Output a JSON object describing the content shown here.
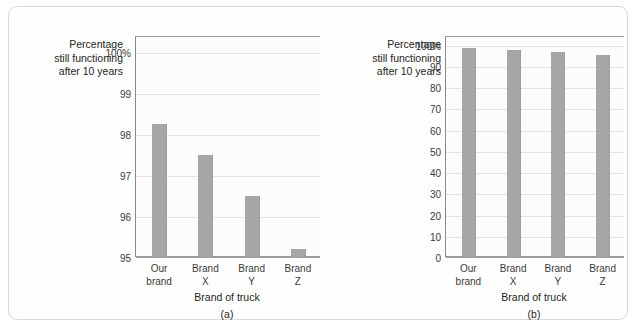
{
  "figure": {
    "panels": [
      {
        "id": "a",
        "letter": "(a)",
        "y_caption": "Percentage\nstill functioning\nafter 10 years",
        "x_caption": "Brand of truck",
        "chart_data": {
          "type": "bar",
          "title": "",
          "xlabel": "Brand of truck",
          "ylabel": "Percentage still functioning after 10 years",
          "categories": [
            "Our\nbrand",
            "Brand\nX",
            "Brand\nY",
            "Brand\nZ"
          ],
          "values": [
            98.25,
            97.5,
            96.5,
            95.2
          ],
          "ylim": [
            95,
            100.4
          ],
          "yticks": [
            95,
            96,
            97,
            98,
            99,
            100
          ],
          "ytick_labels": [
            "95",
            "96",
            "97",
            "98",
            "99",
            "100%"
          ],
          "grid": true,
          "legend": "none",
          "bar_color": "#a6a6a6"
        }
      },
      {
        "id": "b",
        "letter": "(b)",
        "y_caption": "Percentage\nstill functioning\nafter 10 years",
        "x_caption": "Brand of truck",
        "chart_data": {
          "type": "bar",
          "title": "",
          "xlabel": "Brand of truck",
          "ylabel": "Percentage still functioning after 10 years",
          "categories": [
            "Our\nbrand",
            "Brand\nX",
            "Brand\nY",
            "Brand\nZ"
          ],
          "values": [
            98.25,
            97.5,
            96.5,
            95.2
          ],
          "ylim": [
            0,
            104
          ],
          "yticks": [
            0,
            10,
            20,
            30,
            40,
            50,
            60,
            70,
            80,
            90,
            100
          ],
          "ytick_labels": [
            "0",
            "10",
            "20",
            "30",
            "40",
            "50",
            "60",
            "70",
            "80",
            "90",
            "100%"
          ],
          "grid": true,
          "legend": "none",
          "bar_color": "#a6a6a6"
        }
      }
    ]
  }
}
